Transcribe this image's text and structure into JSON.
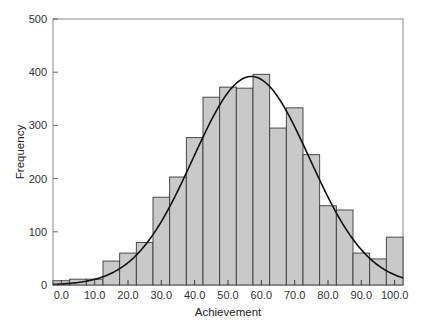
{
  "chart_data": {
    "type": "bar",
    "subtype": "histogram_with_normal_curve",
    "title": "",
    "xlabel": "Achievement",
    "ylabel": "Frequency",
    "xlim": [
      -2.5,
      102.5
    ],
    "ylim": [
      0,
      500
    ],
    "grid": false,
    "legend": null,
    "x_tick_labels": [
      "0.0",
      "10.0",
      "20.0",
      "30.0",
      "40.0",
      "50.0",
      "60.0",
      "70.0",
      "80.0",
      "90.0",
      "100.0"
    ],
    "x_ticks": [
      0,
      10,
      20,
      30,
      40,
      50,
      60,
      70,
      80,
      90,
      100
    ],
    "y_tick_labels": [
      "0",
      "100",
      "200",
      "300",
      "400",
      "500"
    ],
    "y_ticks": [
      0,
      100,
      200,
      300,
      400,
      500
    ],
    "bin_width": 5,
    "categories": [
      0,
      5,
      10,
      15,
      20,
      25,
      30,
      35,
      40,
      45,
      50,
      55,
      60,
      65,
      70,
      75,
      80,
      85,
      90,
      95,
      100
    ],
    "values": [
      8,
      11,
      11,
      45,
      60,
      80,
      165,
      203,
      277,
      353,
      372,
      370,
      396,
      295,
      333,
      245,
      149,
      141,
      60,
      49,
      90
    ],
    "normal_curve": {
      "mean": 57,
      "sd": 17.5,
      "peak": 392
    },
    "colors": {
      "bar_fill": "#c9c9c9",
      "bar_stroke": "#3a3a3a",
      "curve": "#111111",
      "axis": "#666666"
    }
  }
}
